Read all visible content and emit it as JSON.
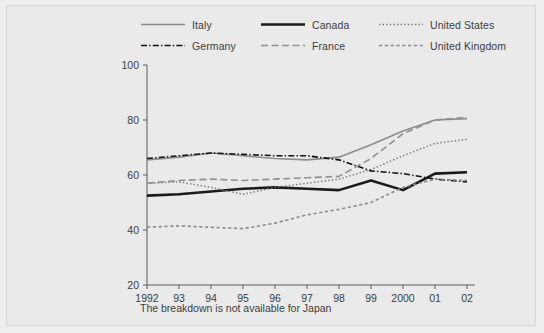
{
  "figure": {
    "background_color": "#eaeaea",
    "border_color": "#d6d6d6"
  },
  "footnote": "The breakdown is not available for Japan",
  "legend": {
    "rows": [
      [
        {
          "label": "Italy",
          "key": "italy"
        },
        {
          "label": "Canada",
          "key": "canada"
        },
        {
          "label": "United States",
          "key": "united_states"
        }
      ],
      [
        {
          "label": "Germany",
          "key": "germany"
        },
        {
          "label": "France",
          "key": "france"
        },
        {
          "label": "United Kingdom",
          "key": "united_kingdom"
        }
      ]
    ]
  },
  "axis": {
    "y_ticks": [
      "100",
      "80",
      "60",
      "40",
      "20"
    ],
    "x_ticks": [
      "1992",
      "93",
      "94",
      "95",
      "96",
      "97",
      "98",
      "99",
      "2000",
      "01",
      "02"
    ]
  },
  "chart_data": {
    "type": "line",
    "title": "",
    "xlabel": "",
    "ylabel": "",
    "xlim": [
      1992,
      2002
    ],
    "ylim": [
      20,
      100
    ],
    "yticks": [
      20,
      40,
      60,
      80,
      100
    ],
    "grid": false,
    "legend_position": "top",
    "annotations": [
      "The breakdown is not available for Japan"
    ],
    "x": [
      1992,
      1993,
      1994,
      1995,
      1996,
      1997,
      1998,
      1999,
      2000,
      2001,
      2002
    ],
    "categories": [
      "1992",
      "93",
      "94",
      "95",
      "96",
      "97",
      "98",
      "99",
      "2000",
      "01",
      "02"
    ],
    "series": [
      {
        "name": "Italy",
        "key": "italy",
        "color": "#8c8c8c",
        "style": "solid",
        "width": 1.6,
        "values": [
          65.5,
          66.5,
          68.0,
          67.0,
          66.0,
          65.5,
          66.5,
          71.0,
          76.0,
          80.0,
          80.5
        ]
      },
      {
        "name": "Canada",
        "key": "canada",
        "color": "#1a1a1a",
        "style": "solid",
        "width": 2.6,
        "values": [
          52.5,
          53.0,
          54.0,
          55.0,
          55.5,
          55.0,
          54.5,
          58.0,
          54.5,
          60.5,
          61.0
        ]
      },
      {
        "name": "United States",
        "key": "united_states",
        "color": "#7a7a7a",
        "style": "dotted",
        "width": 1.5,
        "values": [
          57.0,
          57.5,
          55.5,
          53.0,
          55.5,
          57.0,
          58.5,
          62.0,
          67.0,
          71.5,
          73.0
        ]
      },
      {
        "name": "Germany",
        "key": "germany",
        "color": "#111111",
        "style": "dashdot",
        "width": 1.6,
        "values": [
          66.0,
          67.0,
          68.0,
          67.5,
          67.0,
          67.0,
          65.5,
          61.5,
          60.5,
          58.5,
          57.5
        ]
      },
      {
        "name": "France",
        "key": "france",
        "color": "#909090",
        "style": "longdash",
        "width": 1.6,
        "values": [
          57.0,
          58.0,
          58.5,
          58.0,
          58.5,
          59.0,
          59.5,
          66.0,
          75.0,
          80.0,
          81.0
        ]
      },
      {
        "name": "United Kingdom",
        "key": "united_kingdom",
        "color": "#8a8a8a",
        "style": "dashed",
        "width": 1.6,
        "values": [
          41.0,
          41.5,
          41.0,
          40.5,
          42.5,
          45.5,
          47.5,
          50.0,
          55.5,
          58.5,
          58.0
        ]
      }
    ]
  }
}
